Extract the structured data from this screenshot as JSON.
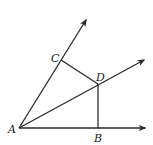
{
  "diagram": {
    "points": {
      "A": {
        "label": "A",
        "x": 19,
        "y": 128
      },
      "B": {
        "label": "B",
        "x": 98,
        "y": 128
      },
      "C": {
        "label": "C",
        "x": 61,
        "y": 60
      },
      "D": {
        "label": "D",
        "x": 98,
        "y": 84
      }
    },
    "rays": [
      {
        "name": "ray-AC",
        "from": "A",
        "through": "C"
      },
      {
        "name": "ray-AD",
        "from": "A",
        "through": "D"
      },
      {
        "name": "ray-AB",
        "from": "A",
        "through": "B"
      }
    ],
    "segments": [
      {
        "name": "segment-CD",
        "from": "C",
        "to": "D"
      },
      {
        "name": "segment-DB",
        "from": "D",
        "to": "B"
      }
    ],
    "line_color": "#2a2a2a"
  }
}
